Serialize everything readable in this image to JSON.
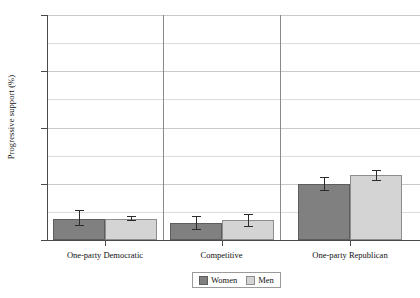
{
  "chart_data": {
    "type": "bar",
    "title": "",
    "subtitle": "",
    "xlabel": "",
    "ylabel": "Progressive support (%)",
    "categories": [
      "One-party Democratic",
      "Competitive",
      "One-party Republican"
    ],
    "series": [
      {
        "name": "Women",
        "color": "#808080",
        "values": [
          7.5,
          6.0,
          20.0
        ],
        "ci_low": [
          5.0,
          3.5,
          17.5
        ],
        "ci_high": [
          10.5,
          8.5,
          22.5
        ]
      },
      {
        "name": "Men",
        "color": "#d4d4d4",
        "values": [
          7.5,
          7.0,
          23.0
        ],
        "ci_low": [
          6.7,
          4.6,
          21.0
        ],
        "ci_high": [
          8.5,
          9.4,
          25.0
        ]
      }
    ],
    "ylim": [
      0,
      80
    ],
    "yticks": [
      0,
      20,
      40,
      60,
      80
    ],
    "ytick_labels": [
      "0",
      "20",
      "40",
      "60",
      "80"
    ],
    "y_minor_gridlines": [
      10,
      30,
      50,
      70
    ],
    "grid": true,
    "grid_axis": "y",
    "legend_position": "bottom",
    "panel_separators": true,
    "error_bars": "confidence interval"
  },
  "legend": {
    "items": [
      {
        "label": "Women",
        "swatch": "women"
      },
      {
        "label": "Men",
        "swatch": "men"
      }
    ]
  },
  "axis": {
    "y_label": "Progressive support (%)"
  }
}
